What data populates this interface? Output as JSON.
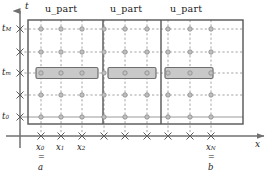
{
  "figure": {
    "type": "space-time-grid-diagram",
    "axes": {
      "t_axis_label": "t",
      "x_axis_label": "x"
    },
    "t_ticks": [
      {
        "label": "t",
        "sub": "M",
        "y": 29,
        "labeled": true
      },
      {
        "label": "",
        "sub": "",
        "y": 52,
        "labeled": false
      },
      {
        "label": "t",
        "sub": "m",
        "y": 73,
        "labeled": true
      },
      {
        "label": "",
        "sub": "",
        "y": 95,
        "labeled": false
      },
      {
        "label": "t",
        "sub": "0",
        "y": 117,
        "labeled": true
      }
    ],
    "x_ticks": [
      {
        "label": "x",
        "sub": "0",
        "x": 41,
        "labeled": true,
        "eq": "a"
      },
      {
        "label": "x",
        "sub": "1",
        "x": 61,
        "labeled": true,
        "eq": ""
      },
      {
        "label": "x",
        "sub": "2",
        "x": 82,
        "labeled": true,
        "eq": ""
      },
      {
        "label": "",
        "sub": "",
        "x": 104,
        "labeled": false,
        "eq": ""
      },
      {
        "label": "",
        "sub": "",
        "x": 125,
        "labeled": false,
        "eq": ""
      },
      {
        "label": "",
        "sub": "",
        "x": 147,
        "labeled": false,
        "eq": ""
      },
      {
        "label": "",
        "sub": "",
        "x": 168,
        "labeled": false,
        "eq": ""
      },
      {
        "label": "",
        "sub": "",
        "x": 190,
        "labeled": false,
        "eq": ""
      },
      {
        "label": "x",
        "sub": "N",
        "x": 211,
        "labeled": true,
        "eq": "b"
      }
    ],
    "blocks": [
      {
        "label": "u_part",
        "x0": 32,
        "x1": 103,
        "label_x": 67
      },
      {
        "label": "u_part",
        "x0": 103,
        "x1": 161,
        "label_x": 131
      },
      {
        "label": "u_part",
        "x0": 161,
        "x1": 219,
        "label_x": 190
      }
    ],
    "highlight_row_t": 73,
    "highlights": [
      {
        "x0": 36,
        "x1": 98
      },
      {
        "x0": 108,
        "x1": 156
      },
      {
        "x0": 165,
        "x1": 213
      }
    ],
    "equals_glyph": "=",
    "frame": {
      "x0": 28,
      "y0": 20,
      "x1": 243,
      "y1": 124
    },
    "colors": {
      "grid_dash": "#8d8d8d",
      "node": "#9a9a9a",
      "frame": "#555555",
      "axis": "#707070",
      "highlight_fill": "#c9c9c9",
      "highlight_stroke": "#6e6e6e",
      "text": "#1a1a1a"
    }
  }
}
